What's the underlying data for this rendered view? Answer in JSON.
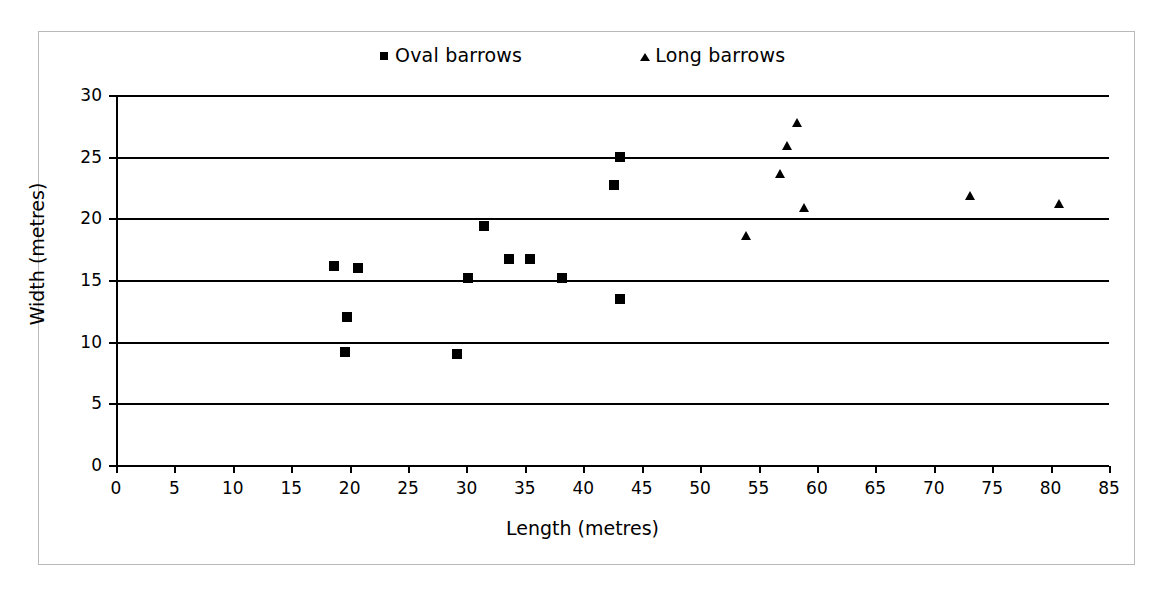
{
  "figure": {
    "background_color": "#ffffff",
    "frame_color": "#b9b9b9",
    "ink_color": "#000000"
  },
  "legend": {
    "position": "top",
    "entries": [
      {
        "label": "Oval barrows",
        "marker": "square-marker",
        "color": "#000000"
      },
      {
        "label": "Long barrows",
        "marker": "triangle-marker",
        "color": "#000000"
      }
    ]
  },
  "axes": {
    "x": {
      "label": "Length (metres)",
      "min": 0,
      "max": 85,
      "tick_step": 5,
      "ticks": [
        0,
        5,
        10,
        15,
        20,
        25,
        30,
        35,
        40,
        45,
        50,
        55,
        60,
        65,
        70,
        75,
        80,
        85
      ]
    },
    "y": {
      "label": "Width (metres)",
      "min": 0,
      "max": 30,
      "tick_step": 5,
      "ticks": [
        0,
        5,
        10,
        15,
        20,
        25,
        30
      ],
      "gridlines": [
        5,
        10,
        15,
        20,
        25,
        30
      ]
    }
  },
  "chart_data": {
    "type": "scatter",
    "title": "",
    "xlabel": "Length (metres)",
    "ylabel": "Width (metres)",
    "xlim": [
      0,
      85
    ],
    "ylim": [
      0,
      30
    ],
    "grid": "horizontal",
    "legend_position": "top",
    "series": [
      {
        "name": "Oval barrows",
        "marker": "square",
        "color": "#000000",
        "points": [
          {
            "x": 18.7,
            "y": 16.1
          },
          {
            "x": 20.7,
            "y": 16.0
          },
          {
            "x": 19.8,
            "y": 12.0
          },
          {
            "x": 19.6,
            "y": 9.2
          },
          {
            "x": 29.2,
            "y": 9.0
          },
          {
            "x": 30.1,
            "y": 15.2
          },
          {
            "x": 31.5,
            "y": 19.4
          },
          {
            "x": 33.6,
            "y": 16.7
          },
          {
            "x": 35.4,
            "y": 16.7
          },
          {
            "x": 38.2,
            "y": 15.2
          },
          {
            "x": 42.6,
            "y": 22.7
          },
          {
            "x": 43.1,
            "y": 25.0
          },
          {
            "x": 43.1,
            "y": 13.5
          }
        ]
      },
      {
        "name": "Long barrows",
        "marker": "triangle",
        "color": "#000000",
        "points": [
          {
            "x": 53.9,
            "y": 18.6
          },
          {
            "x": 56.8,
            "y": 23.6
          },
          {
            "x": 57.4,
            "y": 25.9
          },
          {
            "x": 58.3,
            "y": 27.7
          },
          {
            "x": 58.9,
            "y": 20.8
          },
          {
            "x": 73.1,
            "y": 21.8
          },
          {
            "x": 80.7,
            "y": 21.2
          }
        ]
      }
    ]
  }
}
